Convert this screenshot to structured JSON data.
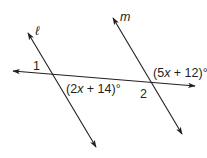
{
  "diagram": {
    "lines": {
      "l": {
        "name": "ℓ"
      },
      "m": {
        "name": "m"
      }
    },
    "angles": {
      "angle1": "1",
      "angle2": "2"
    },
    "expressions": {
      "expr_left_open": "(2",
      "expr_left_var": "x",
      "expr_left_rest": " + 14)°",
      "expr_right_open": "(5",
      "expr_right_var": "x",
      "expr_right_rest": " + 12)°"
    },
    "colors": {
      "stroke": "#231f20",
      "background": "#ffffff"
    }
  }
}
